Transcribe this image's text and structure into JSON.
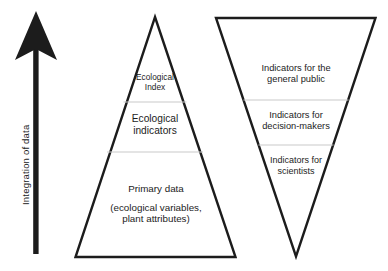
{
  "diagram": {
    "background_color": "#ffffff",
    "stroke_color": "#1c1c1c",
    "divider_color": "#c9c9c9",
    "axis": {
      "caption": "Integration of data",
      "direction": "upward",
      "arrow_name": "integration-arrow"
    },
    "pyramid": {
      "name": "data-integration-pyramid",
      "orientation": "apex-up",
      "tiers": [
        {
          "id": "ecological-index",
          "lines": [
            "Ecological",
            "Index"
          ]
        },
        {
          "id": "ecological-indicators",
          "lines": [
            "Ecological",
            "indicators"
          ]
        },
        {
          "id": "primary-data",
          "lines": [
            "Primary data",
            "(ecological variables,",
            "plant attributes)"
          ]
        }
      ]
    },
    "inverted_triangle": {
      "name": "indicator-audience-triangle",
      "orientation": "apex-down",
      "tiers": [
        {
          "id": "general-public",
          "lines": [
            "Indicators for the",
            "general public"
          ]
        },
        {
          "id": "decision-makers",
          "lines": [
            "Indicators for",
            "decision-makers"
          ]
        },
        {
          "id": "scientists",
          "lines": [
            "Indicators for",
            "scientists"
          ]
        }
      ]
    }
  }
}
